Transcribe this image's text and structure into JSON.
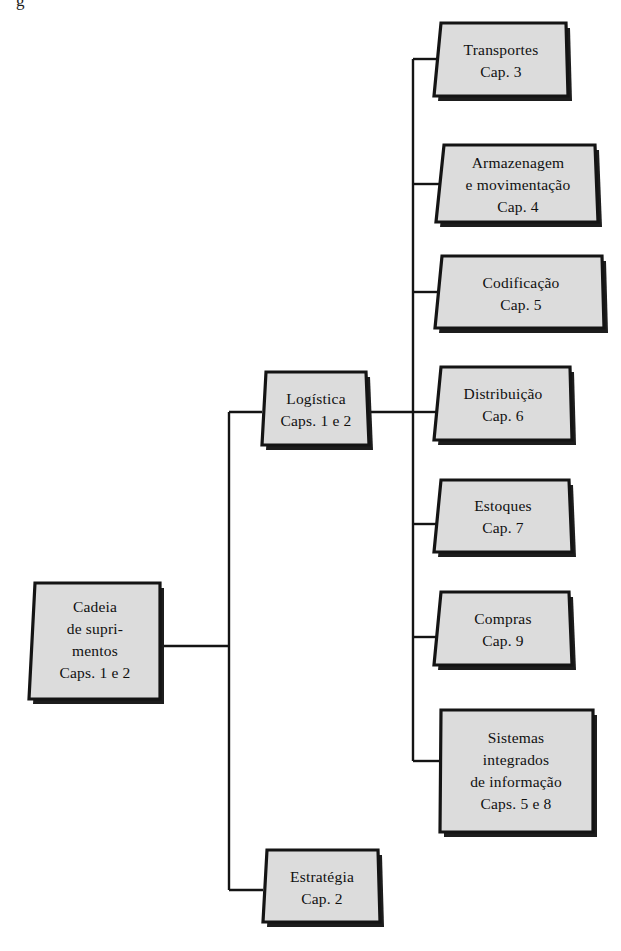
{
  "diagram": {
    "title_fragment": "g",
    "background_color": "#ffffff",
    "node_fill_color": "#dcdcdc",
    "node_border_color": "#141414",
    "connector_color": "#141414",
    "text_color": "#101010",
    "nodes": [
      {
        "id": "cadeia-de-suprimentos",
        "name": "Cadeia de suprimentos",
        "lines": [
          "Cadeia",
          "de supri-",
          "mentos",
          "Caps. 1 e 2"
        ],
        "chapters": "Caps. 1 e 2"
      },
      {
        "id": "logistica",
        "name": "Logística",
        "lines": [
          "Logística",
          "Caps. 1 e 2"
        ],
        "chapters": "Caps. 1 e 2"
      },
      {
        "id": "estrategia",
        "name": "Estratégia",
        "lines": [
          "Estratégia",
          "Cap. 2"
        ],
        "chapters": "Cap. 2"
      },
      {
        "id": "transportes",
        "name": "Transportes",
        "lines": [
          "Transportes",
          "Cap. 3"
        ],
        "chapters": "Cap. 3"
      },
      {
        "id": "armazenagem-e-movimentacao",
        "name": "Armazenagem e movimentação",
        "lines": [
          "Armazenagem",
          "e movimentação",
          "Cap. 4"
        ],
        "chapters": "Cap. 4"
      },
      {
        "id": "codificacao",
        "name": "Codificação",
        "lines": [
          "Codificação",
          "Cap. 5"
        ],
        "chapters": "Cap. 5"
      },
      {
        "id": "distribuicao",
        "name": "Distribuição",
        "lines": [
          "Distribuição",
          "Cap. 6"
        ],
        "chapters": "Cap. 6"
      },
      {
        "id": "estoques",
        "name": "Estoques",
        "lines": [
          "Estoques",
          "Cap. 7"
        ],
        "chapters": "Cap. 7"
      },
      {
        "id": "compras",
        "name": "Compras",
        "lines": [
          "Compras",
          "Cap. 9"
        ],
        "chapters": "Cap. 9"
      },
      {
        "id": "sistemas-integrados-de-informacao",
        "name": "Sistemas integrados de informação",
        "lines": [
          "Sistemas",
          "integrados",
          "de informação",
          "Caps. 5 e 8"
        ],
        "chapters": "Caps. 5 e 8"
      }
    ]
  }
}
